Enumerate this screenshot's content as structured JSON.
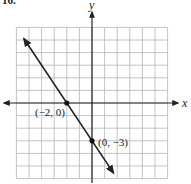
{
  "problem_number": "16.",
  "graph": {
    "x_axis_label": "x",
    "y_axis_label": "y",
    "grid": {
      "xmin": -6,
      "xmax": 6,
      "ymin": -6,
      "ymax": 6,
      "step": 1
    },
    "line": {
      "equation": "y = -3/2 x - 3",
      "slope": -1.5,
      "y_intercept": -3,
      "x_intercept": -2,
      "arrows": "both"
    },
    "points": [
      {
        "x": -2,
        "y": 0,
        "label": "(−2, 0)"
      },
      {
        "x": 0,
        "y": -3,
        "label": "(0, −3)"
      }
    ],
    "colors": {
      "grid": "#b5b5b5",
      "axes": "#222222",
      "line": "#222222"
    }
  }
}
